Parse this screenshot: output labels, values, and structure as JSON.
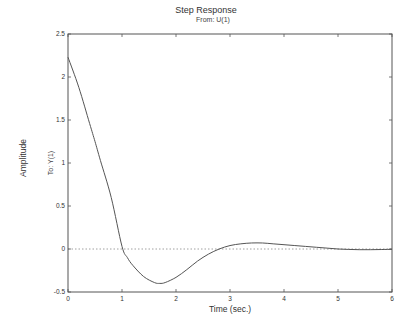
{
  "chart_data": {
    "type": "line",
    "title": "Step Response",
    "subtitle": "From: U(1)",
    "xlabel": "Time (sec.)",
    "ylabel": "Amplitude",
    "ylabel_secondary": "To: Y(1)",
    "xlim": [
      0,
      6
    ],
    "ylim": [
      -0.5,
      2.5
    ],
    "xticks": [
      0,
      1,
      2,
      3,
      4,
      5,
      6
    ],
    "yticks": [
      -0.5,
      0,
      0.5,
      1,
      1.5,
      2,
      2.5
    ],
    "xtick_labels": [
      "0",
      "1",
      "2",
      "3",
      "4",
      "5",
      "6"
    ],
    "ytick_labels": [
      "-0.5",
      "0",
      "0.5",
      "1",
      "1.5",
      "2",
      "2.5"
    ],
    "grid": false,
    "legend": null,
    "reference_line": {
      "y": 0,
      "style": "dotted"
    },
    "series": [
      {
        "name": "Step response",
        "x": [
          0,
          0.2,
          0.4,
          0.5,
          0.6,
          0.8,
          1.0,
          1.1,
          1.2,
          1.4,
          1.6,
          1.7,
          1.8,
          2.0,
          2.2,
          2.4,
          2.6,
          2.8,
          3.0,
          3.2,
          3.4,
          3.6,
          3.8,
          4.0,
          4.2,
          4.4,
          4.6,
          4.8,
          5.0,
          5.2,
          5.4,
          5.6,
          5.8,
          6.0
        ],
        "y": [
          2.23,
          1.88,
          1.46,
          1.25,
          1.03,
          0.6,
          0.03,
          -0.1,
          -0.19,
          -0.32,
          -0.39,
          -0.4,
          -0.39,
          -0.33,
          -0.24,
          -0.14,
          -0.06,
          0.0,
          0.04,
          0.06,
          0.07,
          0.07,
          0.06,
          0.05,
          0.04,
          0.03,
          0.02,
          0.01,
          0.0,
          -0.005,
          -0.008,
          -0.008,
          -0.006,
          -0.004
        ]
      }
    ],
    "colors": {
      "line": "#555555",
      "axes": "#555555",
      "zero_line": "#888888"
    }
  }
}
